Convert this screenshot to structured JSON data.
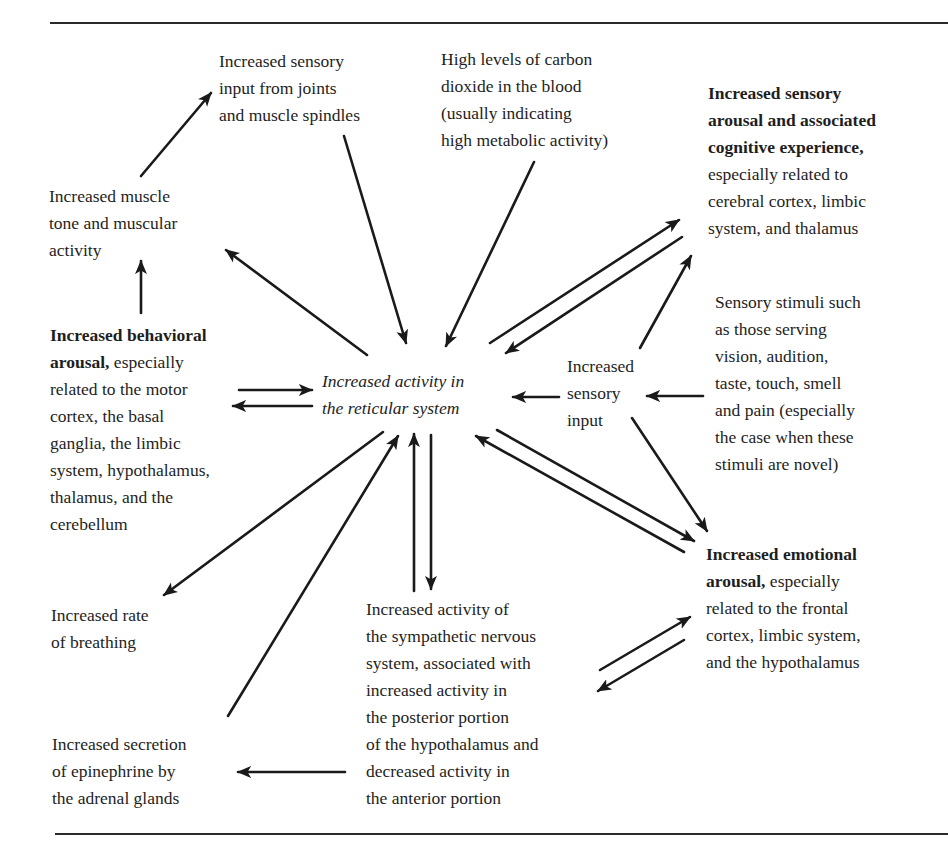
{
  "diagram": {
    "center": {
      "lines": [
        "Increased activity in",
        "the reticular system"
      ]
    },
    "nodes": {
      "joints": {
        "lines": [
          "Increased sensory",
          "input from joints",
          "and muscle spindles"
        ]
      },
      "co2": {
        "lines": [
          "High levels of carbon",
          "dioxide in the blood",
          "(usually indicating",
          "high metabolic activity)"
        ]
      },
      "cognitive": {
        "bold_lines": [
          "Increased sensory",
          "arousal and associated",
          "cognitive experience,"
        ],
        "lines": [
          "especially related to",
          "cerebral cortex, limbic",
          "system, and thalamus"
        ]
      },
      "muscle": {
        "lines": [
          "Increased muscle",
          "tone and muscular",
          "activity"
        ]
      },
      "behavioral": {
        "bold_lead": "Increased behavioral",
        "bold_second": "arousal,",
        "second_rest": " especially",
        "lines": [
          "related to the motor",
          "cortex, the basal",
          "ganglia, the limbic",
          "system, hypothalamus,",
          "thalamus, and the",
          "cerebellum"
        ]
      },
      "sensory_input": {
        "lines": [
          "Increased",
          "sensory",
          "input"
        ]
      },
      "stimuli": {
        "lines": [
          "Sensory stimuli such",
          "as those serving",
          "vision, audition,",
          "taste, touch, smell",
          "and pain (especially",
          "the case when these",
          "stimuli are novel)"
        ]
      },
      "emotional": {
        "bold_lead": "Increased emotional",
        "bold_second": "arousal,",
        "second_rest": " especially",
        "lines": [
          "related to the frontal",
          "cortex, limbic system,",
          "and the hypothalamus"
        ]
      },
      "breathing": {
        "lines": [
          "Increased rate",
          "of breathing"
        ]
      },
      "sympathetic": {
        "lines": [
          "Increased activity of",
          "the sympathetic nervous",
          "system, associated with",
          "increased activity in",
          "the posterior portion",
          "of the hypothalamus and",
          "decreased activity in",
          "the anterior portion"
        ]
      },
      "epinephrine": {
        "lines": [
          "Increased secretion",
          "of epinephrine by",
          "the adrenal glands"
        ]
      }
    },
    "edges": [
      {
        "from": "muscle",
        "to": "joints"
      },
      {
        "from": "joints",
        "to": "center"
      },
      {
        "from": "co2",
        "to": "center"
      },
      {
        "from": "center",
        "to": "cognitive"
      },
      {
        "from": "cognitive",
        "to": "center"
      },
      {
        "from": "center",
        "to": "muscle"
      },
      {
        "from": "behavioral",
        "to": "muscle"
      },
      {
        "from": "behavioral",
        "to": "center"
      },
      {
        "from": "center",
        "to": "behavioral"
      },
      {
        "from": "sensory_input",
        "to": "center"
      },
      {
        "from": "stimuli",
        "to": "sensory_input"
      },
      {
        "from": "sensory_input",
        "to": "cognitive"
      },
      {
        "from": "sensory_input",
        "to": "emotional"
      },
      {
        "from": "center",
        "to": "emotional"
      },
      {
        "from": "emotional",
        "to": "center"
      },
      {
        "from": "center",
        "to": "breathing"
      },
      {
        "from": "epinephrine",
        "to": "center"
      },
      {
        "from": "sympathetic",
        "to": "center"
      },
      {
        "from": "center",
        "to": "sympathetic"
      },
      {
        "from": "sympathetic",
        "to": "emotional"
      },
      {
        "from": "emotional",
        "to": "sympathetic"
      },
      {
        "from": "sympathetic",
        "to": "epinephrine"
      }
    ],
    "colors": {
      "ink": "#1a1a1a",
      "background": "#ffffff"
    }
  }
}
